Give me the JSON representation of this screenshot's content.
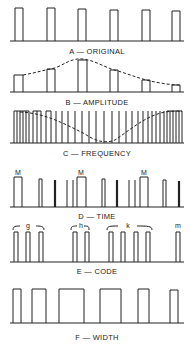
{
  "panels": [
    {
      "id": "A",
      "label": "A — ORIGINAL"
    },
    {
      "id": "B",
      "label": "B — AMPLITUDE"
    },
    {
      "id": "C",
      "label": "C — FREQUENCY"
    },
    {
      "id": "D",
      "label": "D — TIME"
    },
    {
      "id": "E",
      "label": "E — CODE"
    },
    {
      "id": "F",
      "label": "F — WIDTH"
    }
  ],
  "time_markers": [
    "M",
    "M",
    "M"
  ],
  "code_groups": [
    "g",
    "h",
    "k",
    "m"
  ],
  "colors": {
    "ink": "#222222",
    "background": "#ffffff"
  }
}
